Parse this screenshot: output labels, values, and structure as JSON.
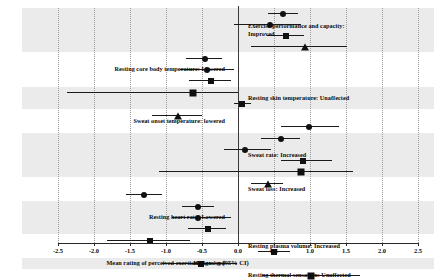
{
  "chart_data": {
    "type": "scatter",
    "title": "",
    "xlabel": "Hedges' g (95% CI)",
    "ylabel": "",
    "xlim": [
      -2.5,
      2.5
    ],
    "xticks": [
      -2.5,
      -2.0,
      -1.5,
      -1.0,
      -0.5,
      0.0,
      0.5,
      1.0,
      1.5,
      2.0,
      2.5
    ],
    "xtick_labels": [
      "-2.5",
      "-2.0",
      "-1.5",
      "-1.0",
      "-0.5",
      "0.0",
      "0.5",
      "1.0",
      "1.5",
      "2.0",
      "2.5"
    ],
    "grid": true,
    "legend": "none",
    "reference_line": 0.0,
    "groups": [
      {
        "label": "Exercise performance  and capacity:\nImproved",
        "label_side": "right",
        "shaded": true,
        "rows": [
          {
            "estimate": 0.63,
            "ci_low": 0.42,
            "ci_high": 0.84,
            "marker": "circle"
          },
          {
            "estimate": 0.45,
            "ci_low": -0.05,
            "ci_high": 0.88,
            "marker": "circle"
          },
          {
            "estimate": 0.66,
            "ci_low": 0.4,
            "ci_high": 0.92,
            "marker": "square"
          },
          {
            "estimate": 0.93,
            "ci_low": 0.18,
            "ci_high": 1.52,
            "marker": "triangle"
          }
        ]
      },
      {
        "label": "Resting core body temperature: Lowered",
        "label_side": "left",
        "shaded": false,
        "rows": [
          {
            "estimate": -0.46,
            "ci_low": -0.72,
            "ci_high": -0.22,
            "marker": "circle"
          },
          {
            "estimate": -0.43,
            "ci_low": -0.8,
            "ci_high": -0.05,
            "marker": "circle"
          },
          {
            "estimate": -0.38,
            "ci_low": -0.68,
            "ci_high": -0.1,
            "marker": "square"
          }
        ]
      },
      {
        "label": "Resting skin temperature:  Unaffected",
        "label_side": "right",
        "shaded": true,
        "rows": [
          {
            "estimate": -0.62,
            "ci_low": -2.38,
            "ci_high": 0.0,
            "marker": "square"
          },
          {
            "estimate": 0.06,
            "ci_low": -0.05,
            "ci_high": 0.18,
            "marker": "square"
          }
        ]
      },
      {
        "label": "Sweat onset temperature:  lowered",
        "label_side": "left",
        "shaded": false,
        "rows": [
          {
            "estimate": -0.84,
            "ci_low": -1.2,
            "ci_high": -0.5,
            "marker": "triangle"
          },
          {
            "estimate": 0.98,
            "ci_low": 0.6,
            "ci_high": 1.4,
            "marker": "circle"
          }
        ]
      },
      {
        "label": "Sweat rate: Increased",
        "label_side": "right",
        "shaded": true,
        "rows": [
          {
            "estimate": 0.6,
            "ci_low": 0.32,
            "ci_high": 0.86,
            "marker": "circle"
          },
          {
            "estimate": 0.1,
            "ci_low": -0.2,
            "ci_high": 0.46,
            "marker": "circle"
          },
          {
            "estimate": 0.9,
            "ci_low": 0.6,
            "ci_high": 1.3,
            "marker": "square"
          },
          {
            "estimate": 0.88,
            "ci_low": -1.1,
            "ci_high": 1.6,
            "marker": "square"
          }
        ]
      },
      {
        "label": "Sweat loss: Increased",
        "label_side": "right",
        "shaded": false,
        "rows": [
          {
            "estimate": 0.42,
            "ci_low": 0.18,
            "ci_high": 0.62,
            "marker": "triangle"
          },
          {
            "estimate": -1.3,
            "ci_low": -1.55,
            "ci_high": -1.05,
            "marker": "circle"
          }
        ]
      },
      {
        "label": "Resting heart rate: Lowered",
        "label_side": "left",
        "shaded": true,
        "rows": [
          {
            "estimate": -0.56,
            "ci_low": -0.78,
            "ci_high": -0.34,
            "marker": "circle"
          },
          {
            "estimate": -0.55,
            "ci_low": -0.92,
            "ci_high": -0.1,
            "marker": "circle"
          },
          {
            "estimate": -0.42,
            "ci_low": -0.7,
            "ci_high": -0.16,
            "marker": "square"
          }
        ]
      },
      {
        "label": "Resting plasma volume: Increased",
        "label_side": "right",
        "shaded": false,
        "rows": [
          {
            "estimate": -1.22,
            "ci_low": -1.82,
            "ci_high": -0.66,
            "marker": "square"
          },
          {
            "estimate": 0.5,
            "ci_low": 0.28,
            "ci_high": 0.72,
            "marker": "square"
          }
        ]
      },
      {
        "label": "Mean rating of perceived exertion: Lowered",
        "label_side": "left",
        "shaded": true,
        "rows": [
          {
            "estimate": -0.52,
            "ci_low": -1.06,
            "ci_high": -0.02,
            "marker": "square"
          }
        ]
      },
      {
        "label": "Resting thermal sensation: Unaffected",
        "label_side": "right",
        "shaded": false,
        "rows": [
          {
            "estimate": 1.02,
            "ci_low": 0.34,
            "ci_high": 1.7,
            "marker": "square"
          }
        ]
      },
      {
        "label": "Mean thermal sensation: Lowered",
        "label_side": "left",
        "shaded": true,
        "rows": [
          {
            "estimate": -0.66,
            "ci_low": -1.18,
            "ci_high": -0.12,
            "marker": "square"
          }
        ]
      }
    ]
  },
  "axis": {
    "title": "Hedges' g (95% CI)"
  }
}
